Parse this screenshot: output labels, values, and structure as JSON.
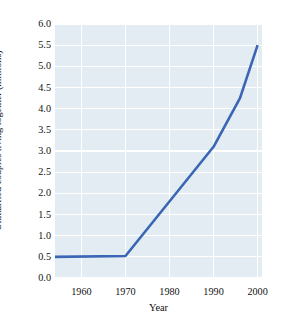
{
  "chart_data": {
    "type": "line",
    "title": "",
    "xlabel": "Year",
    "ylabel": "Unmarried couples living together (millions)",
    "xlim": [
      1954,
      2001
    ],
    "ylim": [
      0.0,
      6.0
    ],
    "grid": true,
    "legend": null,
    "xticks": [
      1960,
      1970,
      1980,
      1990,
      2000
    ],
    "xtick_labels": [
      "1960",
      "1970",
      "1980",
      "1990",
      "2000"
    ],
    "yticks": [
      0.0,
      0.5,
      1.0,
      1.5,
      2.0,
      2.5,
      3.0,
      3.5,
      4.0,
      4.5,
      5.0,
      5.5,
      6.0
    ],
    "ytick_labels": [
      "0.0",
      "0.5",
      "1.0",
      "1.5",
      "2.0",
      "2.5",
      "3.0",
      "3.5",
      "4.0",
      "4.5",
      "5.0",
      "5.5",
      "6.0"
    ],
    "series": [
      {
        "name": "Unmarried couples living together",
        "color": "#3a66b5",
        "line_width": 2.6,
        "x": [
          1954,
          1970,
          1990,
          1996,
          2000
        ],
        "values": [
          0.5,
          0.52,
          3.1,
          4.25,
          5.5
        ]
      }
    ],
    "colors": {
      "line": "#3a66b5",
      "plot_background": "#e3ecf2",
      "gridline": "#ffffff",
      "page_background": "#ffffff",
      "text": "#111111"
    }
  }
}
